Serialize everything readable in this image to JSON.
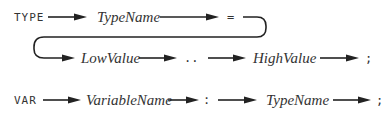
{
  "diagram": {
    "rules": [
      {
        "name": "type-declaration",
        "keyword": "TYPE",
        "type_name": "TypeName",
        "equals": "=",
        "low_value": "LowValue",
        "range": "..",
        "high_value": "HighValue",
        "terminator": ";"
      },
      {
        "name": "var-declaration",
        "keyword": "VAR",
        "variable_name": "VariableName",
        "colon": ":",
        "type_name": "TypeName",
        "terminator": ";"
      }
    ],
    "colors": {
      "text": "#333333",
      "line": "#222222",
      "background": "#ffffff"
    }
  }
}
